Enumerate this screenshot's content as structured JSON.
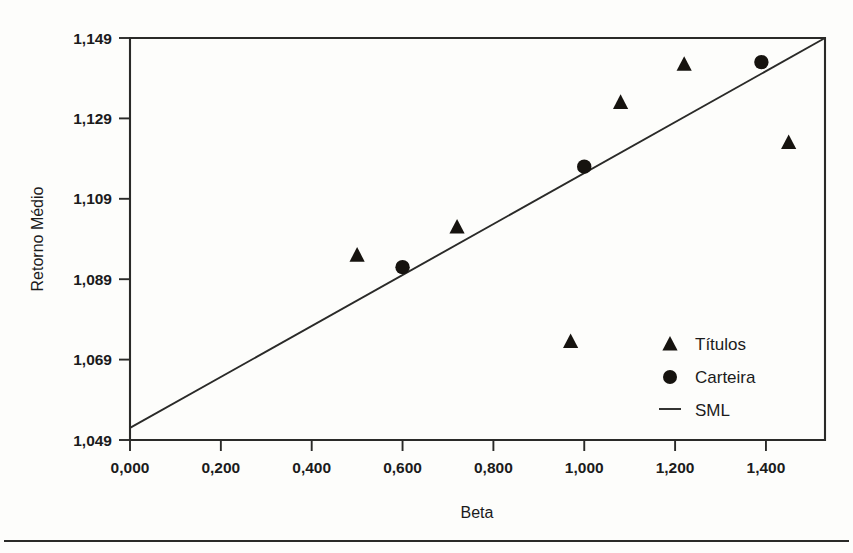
{
  "chart_data": {
    "type": "scatter",
    "title": "",
    "xlabel": "Beta",
    "ylabel": "Retorno Médio",
    "xlim": [
      0.0,
      1.53
    ],
    "ylim": [
      1049,
      1149
    ],
    "grid": false,
    "legend_position": "inside-bottom-right",
    "x_ticks": [
      0.0,
      0.2,
      0.4,
      0.6,
      0.8,
      1.0,
      1.2,
      1.4
    ],
    "x_tick_labels": [
      "0,000",
      "0,200",
      "0,400",
      "0,600",
      "0,800",
      "1,000",
      "1,200",
      "1,400"
    ],
    "y_ticks": [
      1049,
      1069,
      1089,
      1109,
      1129,
      1149
    ],
    "y_tick_labels": [
      "1,049",
      "1,069",
      "1,089",
      "1,109",
      "1,129",
      "1,149"
    ],
    "series": [
      {
        "name": "Títulos",
        "marker": "triangle",
        "color": "#16130f",
        "points": [
          {
            "x": 0.5,
            "y": 1095.0
          },
          {
            "x": 0.72,
            "y": 1102.0
          },
          {
            "x": 0.97,
            "y": 1073.5
          },
          {
            "x": 1.08,
            "y": 1133.0
          },
          {
            "x": 1.22,
            "y": 1142.5
          },
          {
            "x": 1.45,
            "y": 1123.0
          }
        ]
      },
      {
        "name": "Carteira",
        "marker": "circle",
        "color": "#16130f",
        "points": [
          {
            "x": 0.6,
            "y": 1092.0
          },
          {
            "x": 1.0,
            "y": 1117.0
          },
          {
            "x": 1.39,
            "y": 1143.0
          }
        ]
      },
      {
        "name": "SML",
        "marker": "line",
        "color": "#2a2a28",
        "points": [
          {
            "x": 0.0,
            "y": 1052.0
          },
          {
            "x": 1.53,
            "y": 1149.0
          }
        ]
      }
    ],
    "legend_entries": [
      {
        "label": "Títulos",
        "marker": "triangle"
      },
      {
        "label": "Carteira",
        "marker": "circle"
      },
      {
        "label": "SML",
        "marker": "line"
      }
    ]
  }
}
